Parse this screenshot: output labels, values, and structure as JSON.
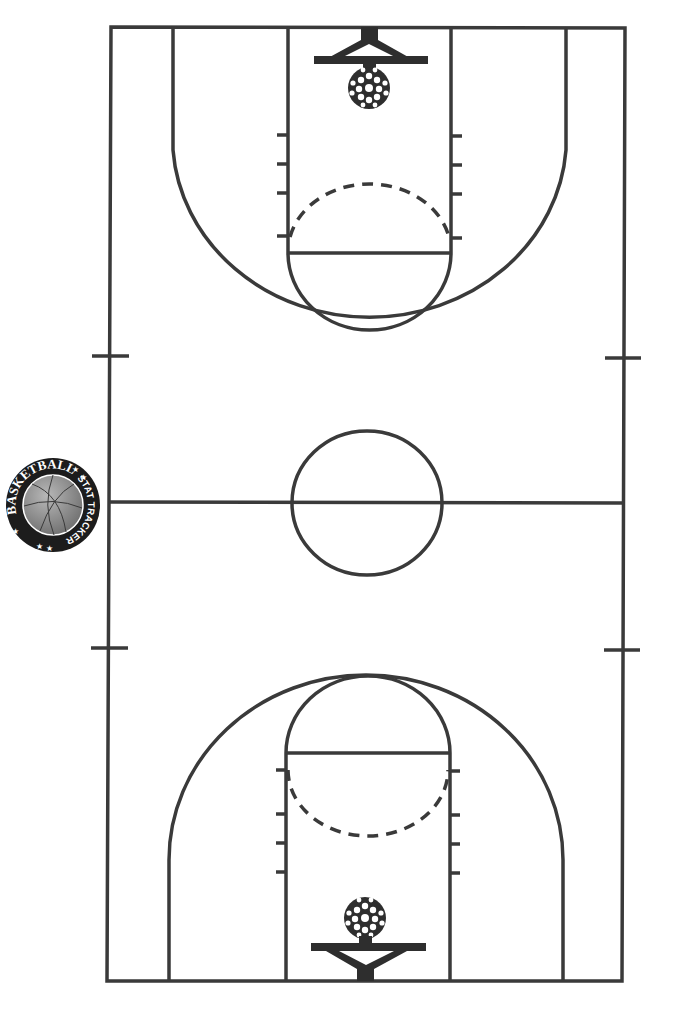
{
  "logo": {
    "title": "BASKETBALL",
    "subtitle": "STAT TRACKER",
    "stars": "★★",
    "colors": {
      "ring": "#1a1a1a",
      "ball": "#8a8a8a",
      "text": "#111111"
    }
  },
  "court": {
    "line_color": "#3a3a3a",
    "background": "#ffffff",
    "baskets": [
      {
        "name": "top-basket",
        "position": "top"
      },
      {
        "name": "bottom-basket",
        "position": "bottom"
      }
    ]
  }
}
